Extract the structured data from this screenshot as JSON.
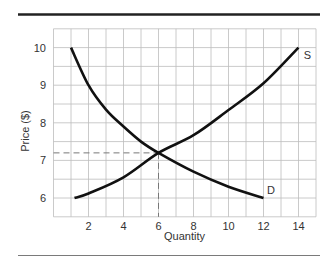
{
  "chart_data": {
    "type": "line",
    "title": "",
    "xlabel": "Quantity",
    "ylabel": "Price ($)",
    "xlim": [
      0,
      15
    ],
    "ylim": [
      5.5,
      10.5
    ],
    "x_ticks": [
      2,
      4,
      6,
      8,
      10,
      12,
      14
    ],
    "y_ticks": [
      6,
      7,
      8,
      9,
      10
    ],
    "grid": true,
    "grid_step_x": 1,
    "grid_step_y": 0.5,
    "legend": "none",
    "series": [
      {
        "name": "S",
        "label": "S",
        "points": [
          [
            1.2,
            6.0
          ],
          [
            2,
            6.12
          ],
          [
            4,
            6.55
          ],
          [
            6,
            7.2
          ],
          [
            8,
            7.67
          ],
          [
            10,
            8.34
          ],
          [
            12,
            9.05
          ],
          [
            14,
            10.0
          ]
        ]
      },
      {
        "name": "D",
        "label": "D",
        "points": [
          [
            1,
            10.0
          ],
          [
            2,
            9.0
          ],
          [
            3,
            8.35
          ],
          [
            4,
            7.9
          ],
          [
            5,
            7.5
          ],
          [
            6,
            7.2
          ],
          [
            8,
            6.7
          ],
          [
            10,
            6.3
          ],
          [
            12,
            6.0
          ]
        ]
      }
    ],
    "equilibrium": {
      "quantity": 6,
      "price": 7.2,
      "dashed_guides": true
    },
    "annotations": [
      {
        "text": "S",
        "x": 14.3,
        "y": 9.8
      },
      {
        "text": "D",
        "x": 12.2,
        "y": 6.2
      }
    ]
  },
  "colors": {
    "curve": "#111111",
    "grid": "#bdbdbd",
    "axis_text": "#333333",
    "top_rule": "#222222",
    "bottom_rule": "#7a7a7a",
    "dash": "#777777"
  }
}
